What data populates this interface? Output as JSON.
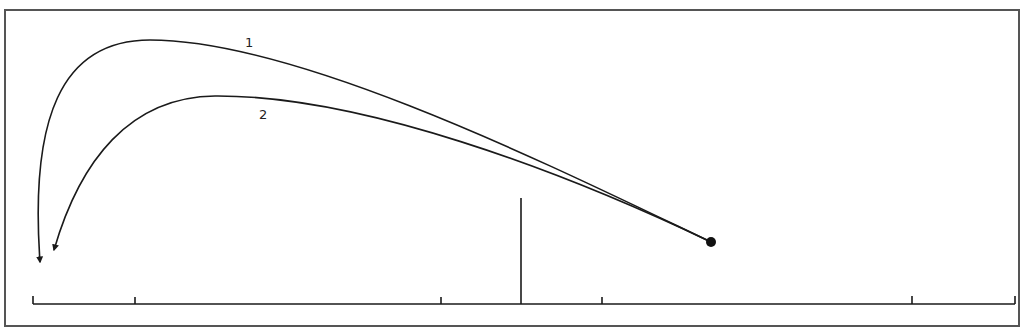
{
  "diagram": {
    "curves": [
      {
        "label": "1",
        "start": [
          711,
          242
        ],
        "end": [
          40,
          268
        ]
      },
      {
        "label": "2",
        "start": [
          711,
          242
        ],
        "end": [
          52,
          256
        ]
      }
    ],
    "start_point": [
      711,
      242
    ],
    "baseline": {
      "y": 304,
      "x_start": 33,
      "x_end": 1015,
      "ticks": [
        33,
        135,
        441,
        602,
        912,
        1015
      ]
    },
    "marker_line": {
      "x": 521,
      "y_top": 198,
      "y_bottom": 304
    },
    "colors": {
      "stroke": "#1a1a1a",
      "frame": "#555555",
      "background": "#ffffff"
    }
  }
}
